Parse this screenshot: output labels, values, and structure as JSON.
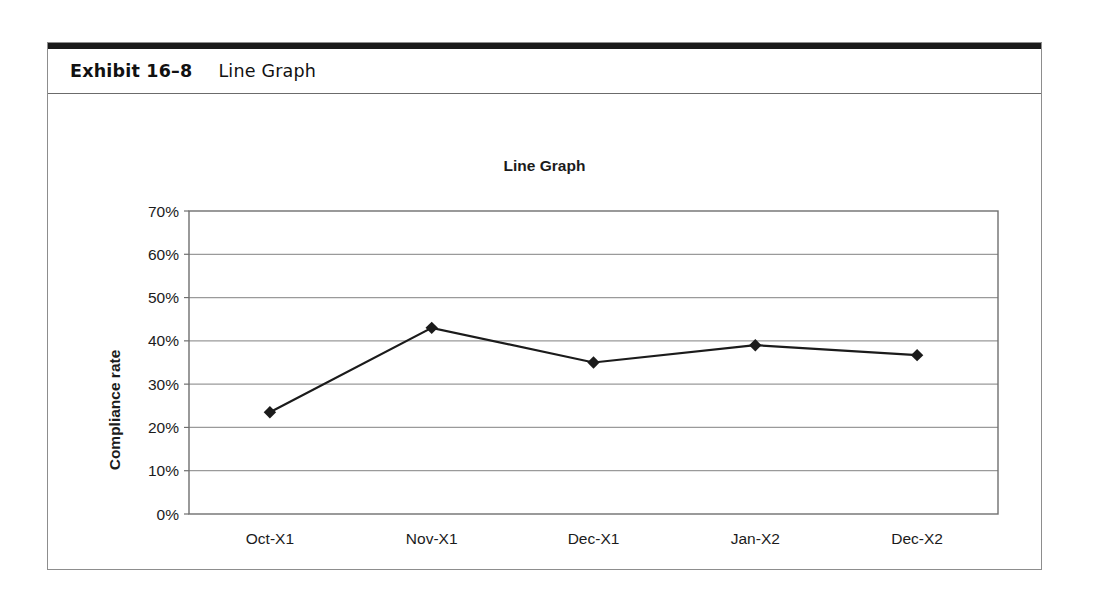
{
  "exhibit": {
    "number": "Exhibit 16–8",
    "title": "Line Graph"
  },
  "chart_data": {
    "type": "line",
    "title": "Line Graph",
    "xlabel": "Month/Year",
    "ylabel": "Compliance rate",
    "categories": [
      "Oct-X1",
      "Nov-X1",
      "Dec-X1",
      "Jan-X2",
      "Dec-X2"
    ],
    "values": [
      23.5,
      43,
      35,
      39,
      36.7
    ],
    "ylim": [
      0,
      70
    ],
    "yticks": [
      "0%",
      "10%",
      "20%",
      "30%",
      "40%",
      "50%",
      "60%",
      "70%"
    ],
    "ytick_values": [
      0,
      10,
      20,
      30,
      40,
      50,
      60,
      70
    ],
    "grid": "horizontal",
    "legend": "none",
    "series_color": "#1b1b1b",
    "marker": "diamond",
    "gridline_color": "#9a9a9a",
    "plot_border_color": "#6f6f6f"
  }
}
